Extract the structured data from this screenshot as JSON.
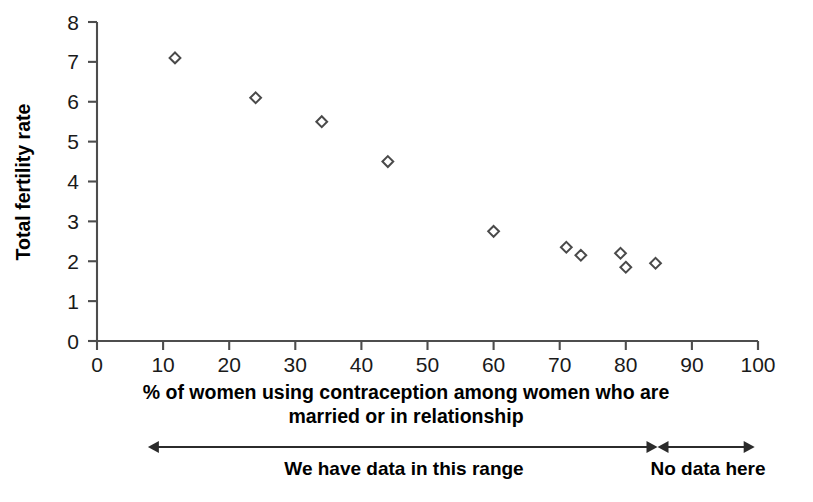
{
  "chart_data": {
    "type": "scatter",
    "title": "",
    "xlabel": "% of women using contraception among women who are married or in relationship",
    "xlabel_line1": "% of women using contraception among women who are",
    "xlabel_line2": "married or in relationship",
    "ylabel": "Total fertility rate",
    "xlim": [
      0,
      100
    ],
    "ylim": [
      0,
      8
    ],
    "xticks": [
      0,
      10,
      20,
      30,
      40,
      50,
      60,
      70,
      80,
      90,
      100
    ],
    "yticks": [
      0,
      1,
      2,
      3,
      4,
      5,
      6,
      7,
      8
    ],
    "xtick_labels": [
      "0",
      "10",
      "20",
      "30",
      "40",
      "50",
      "60",
      "70",
      "80",
      "90",
      "100"
    ],
    "ytick_labels": [
      "0",
      "1",
      "2",
      "3",
      "4",
      "5",
      "6",
      "7",
      "8"
    ],
    "grid": false,
    "legend": false,
    "marker": "diamond",
    "marker_fill": "#ffffff",
    "marker_edge": "#4a4a4a",
    "points": [
      {
        "x": 11.8,
        "y": 7.1
      },
      {
        "x": 24.0,
        "y": 6.1
      },
      {
        "x": 34.0,
        "y": 5.5
      },
      {
        "x": 44.0,
        "y": 4.5
      },
      {
        "x": 60.0,
        "y": 2.75
      },
      {
        "x": 71.0,
        "y": 2.35
      },
      {
        "x": 73.2,
        "y": 2.15
      },
      {
        "x": 79.2,
        "y": 2.2
      },
      {
        "x": 80.0,
        "y": 1.85
      },
      {
        "x": 84.5,
        "y": 1.95
      }
    ],
    "annotations": [
      {
        "label": "We have data in this range",
        "x_start": 7.7,
        "x_end": 84.8
      },
      {
        "label": "No data here",
        "x_start": 84.8,
        "x_end": 99.5
      }
    ]
  },
  "colors": {
    "axis": "#4d4d4d",
    "marker_edge": "#4a4a4a",
    "marker_fill": "#ffffff",
    "annotation": "#2b2b2b",
    "text": "#000000",
    "background": "#ffffff"
  }
}
